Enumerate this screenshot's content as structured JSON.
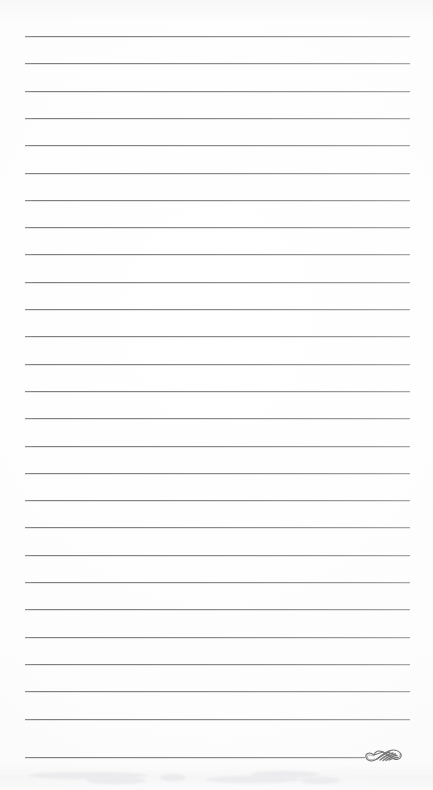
{
  "page": {
    "kind": "ruled-stationery-scan",
    "width_px": 433,
    "height_px": 790,
    "background_color": "#fefefe",
    "content_text": ""
  },
  "rules": {
    "label": "ruled-lines",
    "count": 27,
    "color": "#8a8a8a",
    "thickness_px": 1,
    "left_x_px": 25,
    "right_x_px": 410,
    "first_line_y_px": 36,
    "spacing_px": 27.3,
    "lines_y_px": [
      36,
      63.3,
      90.6,
      117.9,
      145.2,
      172.5,
      199.8,
      227.1,
      254.4,
      281.7,
      309,
      336.3,
      363.6,
      390.9,
      418.2,
      445.5,
      472.8,
      500.1,
      527.4,
      554.7,
      582,
      609.3,
      636.6,
      663.9,
      691.2,
      718.5,
      757
    ]
  },
  "ornament": {
    "label": "calligraphic-swash-flourish",
    "position": "bottom-right-end-of-last-rule",
    "x_px": 364,
    "y_px": 744,
    "width_px": 42,
    "height_px": 22,
    "color": "#6f6f6f"
  },
  "artifacts": {
    "bottom_scan_smudge": {
      "label": "faint-scan-ghosting",
      "y_px": 764,
      "visible": true
    }
  }
}
